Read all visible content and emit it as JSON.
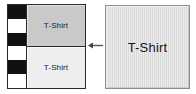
{
  "diagram": {
    "split_view": {
      "stripe_bar": {
        "name": "barcode-stripe-bar",
        "segments": [
          "#111111",
          "#ffffff",
          "#111111",
          "#ffffff",
          "#111111",
          "#ffffff"
        ]
      },
      "cells": [
        {
          "label": "T-Shirt",
          "fill": "#c9c9c9"
        },
        {
          "label": "T-Shirt",
          "fill": "#eeeeee"
        }
      ]
    },
    "arrow": {
      "icon": "arrow-left-icon",
      "direction": "left",
      "color": "#555555"
    },
    "source_box": {
      "label": "T-Shirt",
      "fill": "#e2e2e2",
      "stripe_color": "#d9d9d9",
      "border": "#8e8e8e"
    }
  }
}
